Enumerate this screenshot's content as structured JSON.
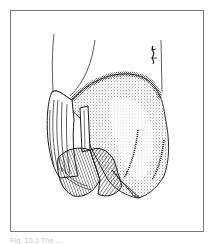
{
  "figure": {
    "caption": "Fig. 10.1 The ...",
    "signature": "artist-signature",
    "colors": {
      "ink": "#1a1a1a",
      "frame": "#7a7a7a",
      "background": "#ffffff",
      "caption": "#c8c8c8"
    }
  }
}
